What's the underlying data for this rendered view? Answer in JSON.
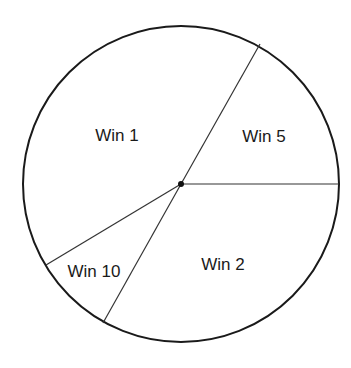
{
  "diagram": {
    "type": "window-partition-wheel",
    "circle": {
      "cx": 181,
      "cy": 184,
      "r": 158,
      "stroke": "#1a1a1a"
    },
    "center_dot": {
      "cx": 181,
      "cy": 184,
      "r": 3
    },
    "dividers": [
      {
        "name": "divider-upper-right",
        "x2": 260,
        "y2": 44
      },
      {
        "name": "divider-right",
        "x2": 339,
        "y2": 184
      },
      {
        "name": "divider-lower-left",
        "x2": 103,
        "y2": 323
      },
      {
        "name": "divider-left",
        "x2": 46,
        "y2": 265
      }
    ],
    "regions": [
      {
        "label": "Win 1",
        "x": 117,
        "y": 141
      },
      {
        "label": "Win 5",
        "x": 264,
        "y": 142
      },
      {
        "label": "Win 2",
        "x": 223,
        "y": 270
      },
      {
        "label": "Win 10",
        "x": 94,
        "y": 277
      }
    ]
  }
}
